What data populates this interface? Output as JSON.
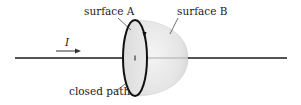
{
  "diagram": {
    "labels": {
      "surface_a": "surface A",
      "surface_b": "surface B",
      "closed_path": "closed path",
      "current": "I"
    },
    "colors": {
      "line": "#1a1a1a",
      "surface_fill": "#e6e6e6",
      "surface_shade": "#d4d4d4",
      "label_text": "#222222"
    }
  }
}
